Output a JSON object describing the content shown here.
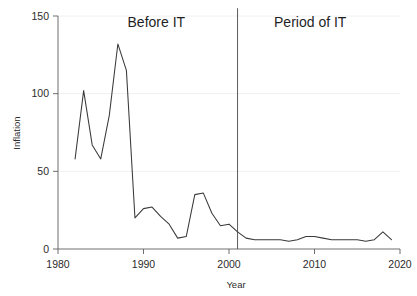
{
  "chart_data": {
    "type": "line",
    "title": "",
    "xlabel": "Year",
    "ylabel": "Inflation",
    "xlim": [
      1980,
      2020
    ],
    "ylim": [
      0,
      150
    ],
    "xticks": [
      1980,
      1990,
      2000,
      2010,
      2020
    ],
    "xtick_labels": [
      "1980",
      "1990",
      "2000",
      "2010",
      "2020"
    ],
    "yticks": [
      0,
      50,
      100,
      150
    ],
    "ytick_labels": [
      "0",
      "50",
      "100",
      "150"
    ],
    "grid": true,
    "legend": "none",
    "line_color": "#3a3a3a",
    "x": [
      1982,
      1983,
      1984,
      1985,
      1986,
      1987,
      1988,
      1989,
      1990,
      1991,
      1992,
      1993,
      1994,
      1995,
      1996,
      1997,
      1998,
      1999,
      2000,
      2001,
      2002,
      2003,
      2004,
      2005,
      2006,
      2007,
      2008,
      2009,
      2010,
      2011,
      2012,
      2013,
      2014,
      2015,
      2016,
      2017,
      2018,
      2019
    ],
    "values": [
      58,
      102,
      67,
      58,
      86,
      132,
      115,
      20,
      26,
      27,
      21,
      16,
      7,
      8,
      35,
      36,
      23,
      15,
      16,
      11,
      7,
      6,
      6,
      6,
      6,
      5,
      6,
      8,
      8,
      7,
      6,
      6,
      6,
      6,
      5,
      6,
      11,
      6
    ],
    "series": [
      {
        "name": "Inflation",
        "values": [
          58,
          102,
          67,
          58,
          86,
          132,
          115,
          20,
          26,
          27,
          21,
          16,
          7,
          8,
          35,
          36,
          23,
          15,
          16,
          11,
          7,
          6,
          6,
          6,
          6,
          5,
          6,
          8,
          8,
          7,
          6,
          6,
          6,
          6,
          5,
          6,
          11,
          6
        ]
      }
    ],
    "annotations": [
      {
        "name": "before-it-label",
        "text": "Before IT",
        "x": 1991.5,
        "y": 143
      },
      {
        "name": "period-of-it-label",
        "text": "Period of IT",
        "x": 2009.5,
        "y": 143
      }
    ],
    "vlines": [
      {
        "name": "it-start-divider",
        "x": 2001,
        "y_top": 155,
        "y_bottom": 0
      }
    ]
  }
}
